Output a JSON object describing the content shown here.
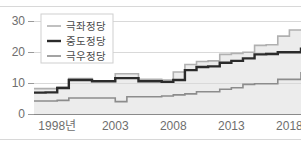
{
  "chart_data": {
    "type": "line",
    "title": "",
    "subtitle": "",
    "xlabel": "",
    "ylabel": "",
    "xlim": [
      1996,
      2019
    ],
    "ylim": [
      0,
      33
    ],
    "grid": true,
    "step": "post",
    "legend_position": "top-left",
    "x": [
      1996,
      1997,
      1998,
      1999,
      2000,
      2001,
      2002,
      2003,
      2004,
      2005,
      2006,
      2007,
      2008,
      2009,
      2010,
      2011,
      2012,
      2013,
      2014,
      2015,
      2016,
      2017,
      2018,
      2019
    ],
    "xtick_values": [
      1998,
      2003,
      2008,
      2013,
      2018
    ],
    "xtick_labels": [
      "1998년",
      "2003",
      "2008",
      "2013",
      "2018"
    ],
    "ytick_values": [
      0,
      10,
      20,
      30
    ],
    "ytick_labels": [
      "0",
      "10",
      "20",
      "30"
    ],
    "series": [
      {
        "name": "극좌정당",
        "color": "#b0b0b0",
        "width": 1.6,
        "values": [
          8.2,
          8.2,
          8.6,
          11.5,
          11.5,
          10.6,
          10.6,
          13.0,
          13.0,
          11.2,
          11.2,
          11.0,
          13.6,
          16.0,
          17.0,
          17.2,
          19.3,
          19.6,
          20.0,
          22.2,
          22.4,
          25.2,
          27.2,
          27.2
        ]
      },
      {
        "name": "중도정당",
        "color": "#2b2b2b",
        "width": 2.4,
        "values": [
          6.9,
          7.0,
          8.4,
          11.0,
          11.0,
          10.6,
          10.6,
          11.6,
          11.6,
          10.6,
          10.6,
          10.4,
          11.0,
          14.2,
          15.2,
          15.4,
          16.6,
          17.2,
          18.0,
          19.3,
          19.4,
          20.0,
          20.0,
          21.5
        ]
      },
      {
        "name": "극우정당",
        "color": "#8c8c8c",
        "width": 1.6,
        "values": [
          4.2,
          4.2,
          4.4,
          5.2,
          5.2,
          5.2,
          5.2,
          4.0,
          5.6,
          5.6,
          5.6,
          5.8,
          6.2,
          6.5,
          7.2,
          7.2,
          8.0,
          8.5,
          9.6,
          9.8,
          9.8,
          11.2,
          11.2,
          13.6
        ]
      }
    ],
    "legend_entries": [
      {
        "label": "극좌정당",
        "color": "#b0b0b0",
        "style": "thin"
      },
      {
        "label": "중도정당",
        "color": "#2b2b2b",
        "style": "thick"
      },
      {
        "label": "극우정당",
        "color": "#8c8c8c",
        "style": "thin"
      }
    ],
    "area_fill_color": "#ececec",
    "area_fill_series": "극좌정당"
  }
}
